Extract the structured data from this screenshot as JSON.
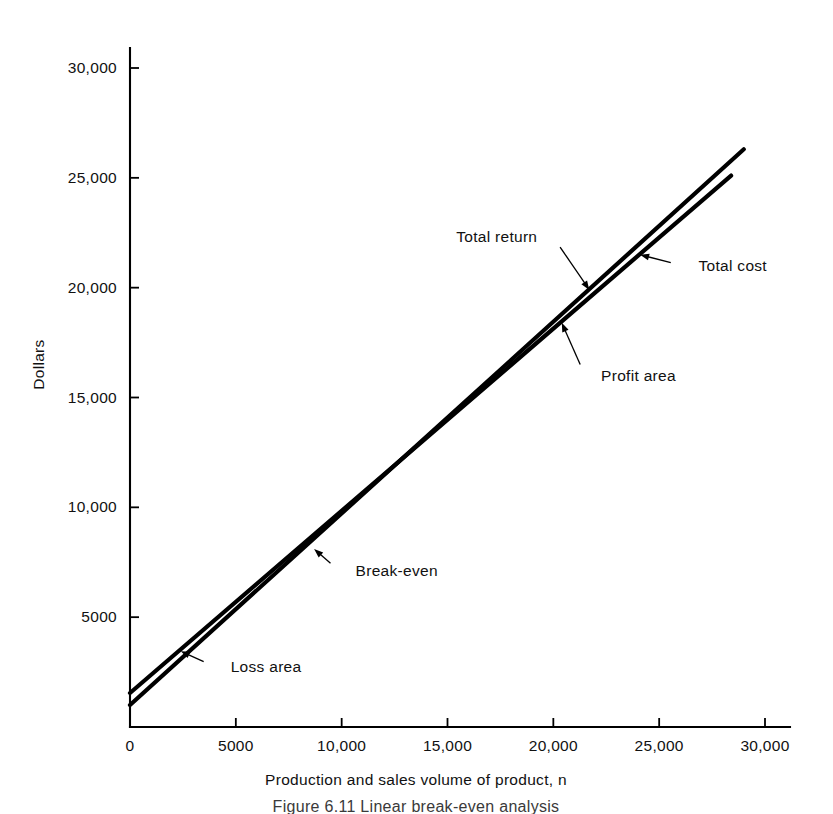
{
  "figure": {
    "caption": "Figure 6.11   Linear break-even analysis",
    "background_color": "#ffffff",
    "ink_color": "#000000"
  },
  "chart_data": {
    "type": "line",
    "title": "",
    "xlabel": "Production and sales volume of product, n",
    "ylabel": "Dollars",
    "xlim": [
      0,
      31500
    ],
    "ylim": [
      0,
      31000
    ],
    "grid": false,
    "legend": "none (direct annotations)",
    "xticks": [
      0,
      5000,
      10000,
      15000,
      20000,
      25000,
      30000
    ],
    "xticklabels": [
      "0",
      "5000",
      "10,000",
      "15,000",
      "20,000",
      "25,000",
      "30,000"
    ],
    "yticks": [
      5000,
      10000,
      15000,
      20000,
      25000,
      30000
    ],
    "yticklabels": [
      "5000",
      "10,000",
      "15,000",
      "20,000",
      "25,000",
      "30,000"
    ],
    "series": [
      {
        "name": "Total return",
        "x": [
          0,
          29000
        ],
        "y": [
          1000,
          26300
        ],
        "intercept": 1000,
        "slope": 0.872,
        "note": "steeper line; passes above total cost beyond break-even"
      },
      {
        "name": "Total cost",
        "x": [
          0,
          28400
        ],
        "y": [
          1550,
          25100
        ],
        "intercept": 1550,
        "slope": 0.829,
        "note": "shallower line; higher fixed cost intercept"
      }
    ],
    "break_even": {
      "x": 7800,
      "y": 7900
    },
    "annotations": [
      {
        "label": "Total return",
        "text_x": 20000,
        "text_y": 22300,
        "point_x": 21700,
        "point_y": 19900
      },
      {
        "label": "Total cost",
        "text_x": 26100,
        "text_y": 21000,
        "point_x": 24100,
        "point_y": 21500
      },
      {
        "label": "Profit area",
        "text_x": 21500,
        "text_y": 16000,
        "point_x": 20400,
        "point_y": 18400
      },
      {
        "label": "Break-even",
        "text_x": 9900,
        "text_y": 7100,
        "point_x": 8700,
        "point_y": 8100
      },
      {
        "label": "Loss area",
        "text_x": 4000,
        "text_y": 2750,
        "point_x": 2400,
        "point_y": 3450
      }
    ]
  }
}
